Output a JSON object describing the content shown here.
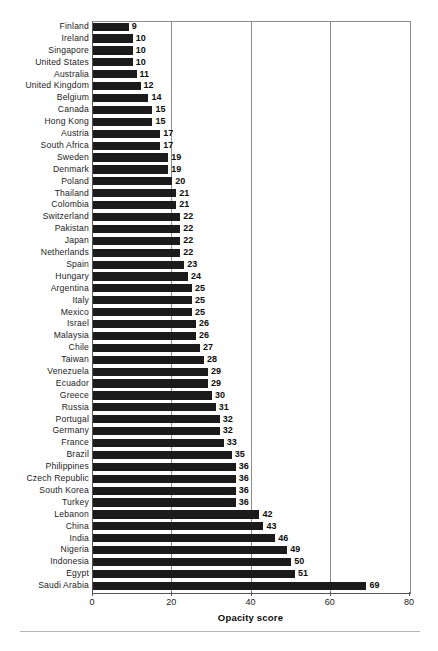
{
  "chart_data": {
    "type": "bar",
    "orientation": "horizontal",
    "title": "",
    "xlabel": "Opacity score",
    "ylabel": "",
    "xlim": [
      0,
      80
    ],
    "xticks": [
      0,
      20,
      40,
      60,
      80
    ],
    "xtick_labels": [
      "0",
      "20",
      "40",
      "60",
      "80"
    ],
    "grid": "vertical",
    "legend": "none",
    "bar_color": "#1b1b1b",
    "value_labels": true,
    "sorted": "ascending",
    "categories": [
      "Finland",
      "Ireland",
      "Singapore",
      "United States",
      "Australia",
      "United Kingdom",
      "Belgium",
      "Canada",
      "Hong Kong",
      "Austria",
      "South Africa",
      "Sweden",
      "Denmark",
      "Poland",
      "Thailand",
      "Colombia",
      "Switzerland",
      "Pakistan",
      "Japan",
      "Netherlands",
      "Spain",
      "Hungary",
      "Argentina",
      "Italy",
      "Mexico",
      "Israel",
      "Malaysia",
      "Chile",
      "Taiwan",
      "Venezuela",
      "Ecuador",
      "Greece",
      "Russia",
      "Portugal",
      "Germany",
      "France",
      "Brazil",
      "Philippines",
      "Czech Republic",
      "South Korea",
      "Turkey",
      "Lebanon",
      "China",
      "India",
      "Nigeria",
      "Indonesia",
      "Egypt",
      "Saudi Arabia"
    ],
    "values": [
      9,
      10,
      10,
      10,
      11,
      12,
      14,
      15,
      15,
      17,
      17,
      19,
      19,
      20,
      21,
      21,
      22,
      22,
      22,
      22,
      23,
      24,
      25,
      25,
      25,
      26,
      26,
      27,
      28,
      29,
      29,
      30,
      31,
      32,
      32,
      33,
      35,
      36,
      36,
      36,
      36,
      42,
      43,
      46,
      49,
      50,
      51,
      69
    ]
  }
}
